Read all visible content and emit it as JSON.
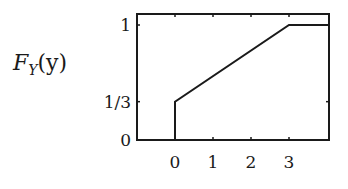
{
  "chart_data": {
    "type": "line",
    "title": "",
    "xlabel": "",
    "ylabel": {
      "main": "F",
      "sub": "Y",
      "arg": "(y)"
    },
    "xlim": [
      -1,
      4.05
    ],
    "ylim": [
      0,
      1.1
    ],
    "xticks": [
      {
        "value": 0,
        "label": "0"
      },
      {
        "value": 1,
        "label": "1"
      },
      {
        "value": 2,
        "label": "2"
      },
      {
        "value": 3,
        "label": "3"
      }
    ],
    "yticks": [
      {
        "value": 0,
        "label": "0"
      },
      {
        "value": 0.3333,
        "label": "1/3"
      },
      {
        "value": 1,
        "label": "1"
      }
    ],
    "grid": false,
    "legend": null,
    "series": [
      {
        "name": "F_Y(y)",
        "points": [
          [
            -1,
            0
          ],
          [
            0,
            0
          ],
          [
            0,
            0.3333
          ],
          [
            3,
            1
          ],
          [
            4.05,
            1
          ]
        ]
      }
    ],
    "color": "#1a1a1a"
  }
}
